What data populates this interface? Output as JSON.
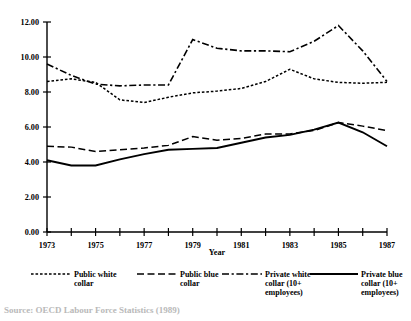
{
  "chart_data": {
    "type": "line",
    "title": "",
    "xlabel": "Year",
    "ylabel": "",
    "xlim": [
      1973,
      1987
    ],
    "ylim": [
      0.0,
      12.0
    ],
    "ytick_step": 2.0,
    "grid": false,
    "legend_position": "bottom",
    "x": [
      1973,
      1974,
      1975,
      1976,
      1977,
      1978,
      1979,
      1980,
      1981,
      1982,
      1983,
      1984,
      1985,
      1986,
      1987
    ],
    "xtick_labels": [
      "1973",
      "1975",
      "1977",
      "1979",
      "1981",
      "1983",
      "1985",
      "1987"
    ],
    "ytick_labels": [
      "0.00",
      "2.00",
      "4.00",
      "6.00",
      "8.00",
      "10.00",
      "12.00"
    ],
    "series": [
      {
        "name": "Public white collar",
        "style": "fine-dotted",
        "values": [
          8.6,
          8.75,
          8.55,
          7.55,
          7.4,
          7.7,
          7.95,
          8.05,
          8.2,
          8.6,
          9.3,
          8.75,
          8.55,
          8.5,
          8.55
        ]
      },
      {
        "name": "Public blue collar",
        "style": "dashed",
        "values": [
          4.9,
          4.85,
          4.6,
          4.7,
          4.8,
          4.95,
          5.45,
          5.25,
          5.35,
          5.6,
          5.6,
          5.8,
          6.25,
          6.05,
          5.8
        ]
      },
      {
        "name": "Private white collar (10+ employees)",
        "style": "dash-dot",
        "values": [
          9.6,
          8.95,
          8.45,
          8.35,
          8.4,
          8.4,
          11.0,
          10.5,
          10.35,
          10.35,
          10.3,
          10.9,
          11.8,
          10.35,
          8.6
        ]
      },
      {
        "name": "Private blue collar (10+ employees)",
        "style": "solid",
        "values": [
          4.1,
          3.8,
          3.8,
          4.15,
          4.45,
          4.7,
          4.75,
          4.8,
          5.1,
          5.4,
          5.55,
          5.85,
          6.25,
          5.7,
          4.9
        ]
      }
    ]
  },
  "legend": {
    "items": [
      {
        "label_line1": "Public white",
        "label_line2": "collar",
        "label_line3": "",
        "style": "fine-dotted"
      },
      {
        "label_line1": "Public blue",
        "label_line2": "collar",
        "label_line3": "",
        "style": "dashed"
      },
      {
        "label_line1": "Private white",
        "label_line2": "collar (10+",
        "label_line3": "employees)",
        "style": "dash-dot"
      },
      {
        "label_line1": "Private blue",
        "label_line2": "collar (10+",
        "label_line3": "employees)",
        "style": "solid"
      }
    ]
  },
  "caption": {
    "text": "Source: OECD Labour Force Statistics (1989)"
  }
}
